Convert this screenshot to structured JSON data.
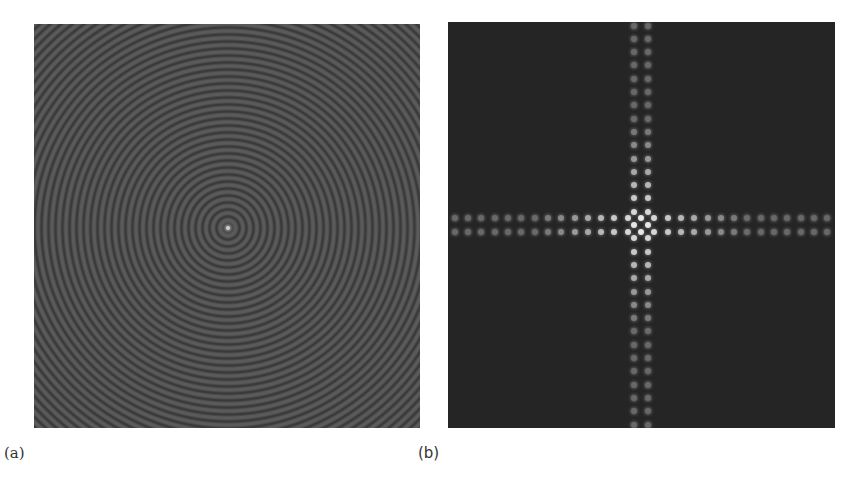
{
  "figure": {
    "panels": [
      {
        "id": "a",
        "label": "(a)",
        "description": "concentric ring pattern",
        "background": "#4a4a4a"
      },
      {
        "id": "b",
        "label": "(b)",
        "description": "Fourier spectrum: cross-shaped pattern of bright dots",
        "background": "#252525"
      }
    ]
  }
}
